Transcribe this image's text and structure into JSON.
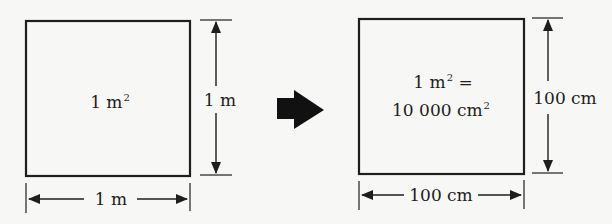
{
  "diagram": {
    "colors": {
      "ink": "#1e1e1e",
      "background": "#f7f7f5"
    },
    "left_square": {
      "area_label": "1 m",
      "area_exponent": "2",
      "height_label": "1 m",
      "width_label": "1 m"
    },
    "transition_arrow": {
      "icon": "right-arrow-icon",
      "direction": "right"
    },
    "right_square": {
      "equation_line1_base": "1 m",
      "equation_line1_exponent": "2",
      "equation_line1_suffix": " =",
      "equation_line2_base": "10 000 cm",
      "equation_line2_exponent": "2",
      "height_label": "100 cm",
      "width_label": "100 cm"
    }
  }
}
